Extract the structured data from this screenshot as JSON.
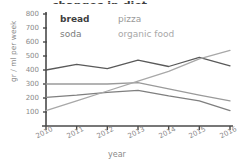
{
  "title_partial": "changes in diet",
  "legend": {
    "bread": "bread",
    "pizza": "pizza",
    "soda": "soda",
    "organic_food": "organic food"
  },
  "axis": {
    "ylabel": "gr / ml per week",
    "xlabel": "year",
    "yticks": [
      "800",
      "700",
      "600",
      "500",
      "400",
      "300",
      "200",
      "100"
    ],
    "xticks": [
      "2010",
      "2011",
      "2012",
      "2013",
      "2014",
      "2015",
      "2016"
    ]
  },
  "colors": {
    "bread": "#5a5a5a",
    "pizza": "#9a9a9a",
    "soda": "#7f7f7f",
    "organic_food": "#a8a8a8",
    "axis": "#4a4a4a",
    "text": "#8a8a8a",
    "background": "#ffffff"
  },
  "chart_data": {
    "type": "line",
    "title": "changes in diet",
    "xlabel": "year",
    "ylabel": "gr / ml per week",
    "x": [
      2010,
      2011,
      2012,
      2013,
      2014,
      2015,
      2016
    ],
    "categories": [
      "2010",
      "2011",
      "2012",
      "2013",
      "2014",
      "2015",
      "2016"
    ],
    "ylim": [
      0,
      800
    ],
    "xlim": [
      2010,
      2016
    ],
    "ytick_step": 100,
    "grid": false,
    "legend_position": "top-inside",
    "series": [
      {
        "name": "bread",
        "color": "#5a5a5a",
        "values": [
          400,
          440,
          410,
          470,
          425,
          490,
          430
        ]
      },
      {
        "name": "pizza",
        "color": "#9a9a9a",
        "values": [
          300,
          300,
          300,
          310,
          265,
          220,
          180
        ]
      },
      {
        "name": "soda",
        "color": "#7f7f7f",
        "values": [
          205,
          220,
          240,
          255,
          215,
          180,
          110
        ]
      },
      {
        "name": "organic food",
        "color": "#a8a8a8",
        "values": [
          110,
          180,
          250,
          320,
          390,
          480,
          540
        ]
      }
    ]
  }
}
